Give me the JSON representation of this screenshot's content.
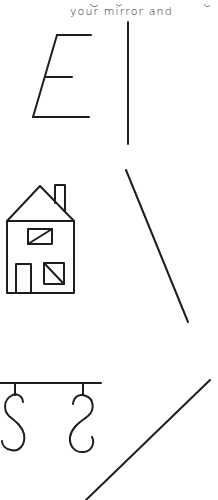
{
  "page": {
    "caption": "your mirror and",
    "ink_color": "#1e1e1e",
    "background": "#ffffff"
  },
  "figures": [
    {
      "id": "letter-e",
      "description": "Italic capital letter E",
      "strokes": [
        [
          57,
          35,
          91,
          35
        ],
        [
          57,
          35,
          33,
          117
        ],
        [
          45,
          77,
          72,
          77
        ],
        [
          33,
          117,
          89,
          117
        ]
      ]
    },
    {
      "id": "vertical-mirror-line",
      "description": "Vertical mirror line",
      "strokes": [
        [
          128,
          22,
          128,
          144
        ]
      ]
    },
    {
      "id": "house",
      "description": "House with chimney, two windows and door",
      "roof": [
        [
          7,
          221
        ],
        [
          40,
          186
        ],
        [
          74,
          221
        ]
      ],
      "chimney": {
        "x": 55,
        "y": 185,
        "w": 10,
        "h": 26
      },
      "body": {
        "x": 7,
        "y": 221,
        "w": 67,
        "h": 72
      },
      "upper_window": {
        "x": 28,
        "y": 229,
        "w": 24,
        "h": 15,
        "diagonal": [
          28,
          244,
          52,
          229
        ]
      },
      "door": {
        "x": 16,
        "y": 264,
        "w": 15,
        "h": 29
      },
      "lower_window": {
        "x": 44,
        "y": 263,
        "w": 20,
        "h": 21,
        "diagonal": [
          44,
          263,
          64,
          284
        ]
      }
    },
    {
      "id": "diagonal-mirror-line-1",
      "description": "Diagonal mirror line sloping down-right",
      "strokes": [
        [
          126,
          170,
          188,
          322
        ]
      ]
    },
    {
      "id": "hooks",
      "description": "Rail with two S-shaped hooks",
      "rail": [
        0,
        383,
        101,
        383
      ],
      "hook1_stem": [
        15,
        383,
        15,
        395
      ],
      "hook2_stem": [
        83,
        383,
        83,
        395
      ]
    },
    {
      "id": "diagonal-mirror-line-2",
      "description": "Diagonal mirror line sloping up-right",
      "strokes": [
        [
          86,
          500,
          210,
          380
        ]
      ]
    }
  ]
}
